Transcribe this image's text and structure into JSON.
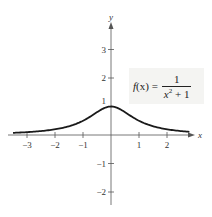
{
  "chart_data": {
    "type": "line",
    "title": "",
    "xlabel": "x",
    "ylabel": "y",
    "xlim": [
      -3.5,
      2.8
    ],
    "ylim": [
      -2.5,
      3.8
    ],
    "x_ticks": [
      -3,
      -2,
      -1,
      1,
      2
    ],
    "y_ticks": [
      -2,
      -1,
      1,
      2,
      3
    ],
    "x_tick_labels": [
      "−3",
      "−2",
      "−1",
      "1",
      "2"
    ],
    "y_tick_labels": [
      "−2",
      "−1",
      "1",
      "2",
      "3"
    ],
    "grid": false,
    "legend": null,
    "annotation": "f(x) = 1 / (x² + 1)",
    "series": [
      {
        "name": "f(x) = 1/(x^2 + 1)",
        "x": [
          -3.5,
          -3,
          -2.5,
          -2,
          -1.5,
          -1,
          -0.5,
          0,
          0.5,
          1,
          1.5,
          2,
          2.5,
          2.8
        ],
        "y": [
          0.075,
          0.1,
          0.138,
          0.2,
          0.308,
          0.5,
          0.8,
          1.0,
          0.8,
          0.5,
          0.308,
          0.2,
          0.138,
          0.113
        ]
      }
    ]
  },
  "axes": {
    "x_name": "x",
    "y_name": "y"
  },
  "formula": {
    "lhs_func": "f",
    "lhs_arg": "(x)",
    "equals": "=",
    "numerator": "1",
    "den_var": "x",
    "den_exp": "2",
    "den_rest": " + 1"
  },
  "colors": {
    "curve": "#1a1a1a",
    "axis": "#555555",
    "label_bg": "#f4f4f2"
  }
}
